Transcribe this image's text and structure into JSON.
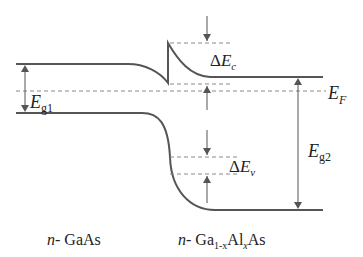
{
  "diagram": {
    "type": "band-diagram",
    "colors": {
      "line": "#555555",
      "dash": "#888888",
      "text": "#222222"
    },
    "labels": {
      "delta_ec": {
        "prefix": "Δ",
        "main": "E",
        "sub": "c"
      },
      "delta_ev": {
        "prefix": "Δ",
        "main": "E",
        "sub": "v"
      },
      "ef": {
        "main": "E",
        "sub": "F"
      },
      "eg1": {
        "main": "E",
        "sub": "g1"
      },
      "eg2": {
        "main": "E",
        "sub": "g2"
      },
      "left_material": {
        "prefix": "n",
        "rest": "- GaAs"
      },
      "right_material": {
        "prefix": "n",
        "rest": "- Ga",
        "sub1": "1-x",
        "mid": "Al",
        "sub2": "x",
        "end": "As"
      }
    },
    "elements": [
      "conduction-band",
      "valence-band",
      "fermi-level",
      "delta-ec-marker",
      "delta-ev-marker",
      "eg1-arrow",
      "eg2-arrow"
    ]
  }
}
